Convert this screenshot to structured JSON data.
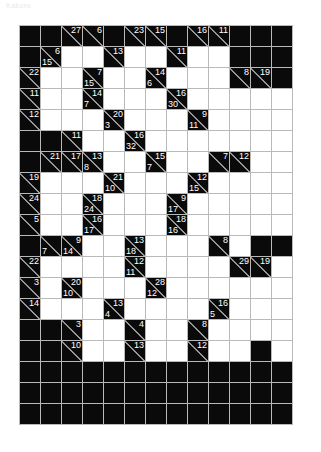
{
  "page": {
    "title": "Kakuro",
    "puzzle_type": "kakuro"
  },
  "grid": {
    "columns": 13,
    "rows": 19,
    "cell_size_px": 21,
    "colors": {
      "block": "#0a0a0a",
      "open": "#ffffff",
      "gridline": "#b9b9b9",
      "slash": "#cfcfcf",
      "clue_text": "#ffffff"
    },
    "legend": {
      "block": "b",
      "open": "o",
      "clue": "[down, across]"
    },
    "cells": [
      [
        "b",
        "b",
        [
          null,
          27
        ],
        [
          null,
          6
        ],
        "b",
        [
          null,
          23
        ],
        [
          null,
          15
        ],
        "b",
        [
          null,
          16
        ],
        [
          null,
          11
        ],
        "b",
        "b",
        "b"
      ],
      [
        "b",
        [
          15,
          6
        ],
        "o",
        "o",
        [
          null,
          13
        ],
        "o",
        "o",
        [
          null,
          11
        ],
        "o",
        "o",
        "b",
        "b",
        "b"
      ],
      [
        [
          null,
          22
        ],
        "o",
        "o",
        [
          15,
          7
        ],
        "o",
        "o",
        [
          6,
          14
        ],
        "o",
        "o",
        "o",
        [
          null,
          8
        ],
        [
          null,
          19
        ],
        "b"
      ],
      [
        [
          null,
          11
        ],
        "o",
        "o",
        [
          7,
          14
        ],
        "o",
        "o",
        "o",
        [
          30,
          16
        ],
        "o",
        "o",
        "o",
        "o",
        "o"
      ],
      [
        [
          null,
          12
        ],
        "o",
        "o",
        "o",
        [
          3,
          20
        ],
        "o",
        "o",
        "o",
        [
          11,
          9
        ],
        "o",
        "o",
        "o",
        "o"
      ],
      [
        "b",
        "b",
        [
          null,
          11
        ],
        "o",
        "o",
        [
          32,
          16
        ],
        "o",
        "o",
        "o",
        "o",
        "o",
        "o",
        "o"
      ],
      [
        "b",
        [
          null,
          21
        ],
        [
          null,
          17
        ],
        [
          8,
          13
        ],
        "o",
        "o",
        [
          7,
          15
        ],
        "o",
        "o",
        [
          null,
          7
        ],
        [
          null,
          12
        ],
        "o",
        "o"
      ],
      [
        [
          null,
          19
        ],
        "o",
        "o",
        "o",
        [
          10,
          21
        ],
        "o",
        "o",
        "o",
        [
          15,
          12
        ],
        "o",
        "o",
        "o",
        "o"
      ],
      [
        [
          null,
          24
        ],
        "o",
        "o",
        [
          24,
          18
        ],
        "o",
        "o",
        "o",
        [
          17,
          9
        ],
        "o",
        "o",
        "o",
        "o",
        "o"
      ],
      [
        [
          null,
          5
        ],
        "o",
        "o",
        [
          17,
          16
        ],
        "o",
        "o",
        "o",
        [
          16,
          18
        ],
        "o",
        "o",
        "o",
        "o",
        "o"
      ],
      [
        "b",
        [
          7,
          null
        ],
        [
          14,
          9
        ],
        "o",
        "o",
        [
          18,
          13
        ],
        "o",
        "o",
        "o",
        [
          null,
          8
        ],
        "o",
        "b",
        "b"
      ],
      [
        [
          null,
          22
        ],
        "o",
        "o",
        "o",
        "o",
        [
          11,
          12
        ],
        "o",
        "o",
        "o",
        "o",
        [
          null,
          29
        ],
        [
          null,
          19
        ],
        "o"
      ],
      [
        [
          null,
          3
        ],
        "o",
        [
          10,
          20
        ],
        "o",
        "o",
        "o",
        [
          12,
          28
        ],
        "o",
        "o",
        "o",
        "o",
        "o",
        "o"
      ],
      [
        [
          null,
          14
        ],
        "o",
        "o",
        "o",
        [
          4,
          13
        ],
        "o",
        "o",
        "o",
        "o",
        [
          5,
          16
        ],
        "o",
        "o",
        "o"
      ],
      [
        "b",
        "b",
        [
          null,
          3
        ],
        "o",
        "o",
        [
          null,
          4
        ],
        "o",
        "o",
        [
          null,
          8
        ],
        "o",
        "o",
        "o",
        "o"
      ],
      [
        "b",
        "b",
        [
          null,
          10
        ],
        "o",
        "o",
        [
          null,
          13
        ],
        "o",
        "o",
        [
          null,
          12
        ],
        "o",
        "o",
        "b",
        "o"
      ],
      [
        "b",
        "b",
        "b",
        "b",
        "b",
        "b",
        "b",
        "b",
        "b",
        "b",
        "b",
        "b",
        "b"
      ],
      [
        "b",
        "b",
        "b",
        "b",
        "b",
        "b",
        "b",
        "b",
        "b",
        "b",
        "b",
        "b",
        "b"
      ],
      [
        "b",
        "b",
        "b",
        "b",
        "b",
        "b",
        "b",
        "b",
        "b",
        "b",
        "b",
        "b",
        "b"
      ]
    ]
  }
}
